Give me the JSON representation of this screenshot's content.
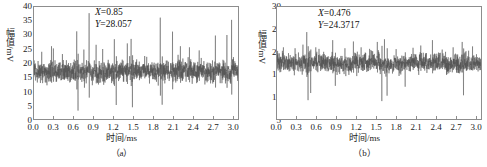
{
  "figure": {
    "background": "#ffffff",
    "trace_color": "#4a4a4a",
    "frame_color": "#8d8d8d"
  },
  "panel_a": {
    "caption": "（a）",
    "xlabel": "时间/ms",
    "ylabel_text": "幅值",
    "ylabel_unit": "/mV",
    "annotation": {
      "x_var": "X",
      "x_eq": "=0.85",
      "y_var": "Y",
      "y_eq": "=28.057"
    },
    "yticks": [
      "40",
      "35",
      "30",
      "25",
      "20",
      "15",
      "10",
      "5",
      "0"
    ],
    "xticks": [
      "0.0",
      "0.3",
      "0.6",
      "0.9",
      "1.2",
      "1.5",
      "1.8",
      "2.1",
      "2.4",
      "2.7",
      "3.0"
    ]
  },
  "panel_b": {
    "caption": "（b）",
    "xlabel": "时间/ms",
    "ylabel_text": "幅值",
    "ylabel_unit": "/mV",
    "annotation": {
      "x_var": "X",
      "x_eq": "=0.476",
      "y_var": "Y",
      "y_eq": "=24.3717"
    },
    "yticks": [
      "30",
      "25",
      "20",
      "15",
      "10",
      "5"
    ],
    "xticks": [
      "0.0",
      "0.3",
      "0.6",
      "0.9",
      "1.2",
      "1.5",
      "1.8",
      "2.1",
      "2.4",
      "2.7",
      "3.0"
    ]
  },
  "chart_data": [
    {
      "type": "line",
      "panel": "(a)",
      "title": "",
      "xlabel": "时间/ms",
      "ylabel": "幅值/mV",
      "xlim": [
        0.0,
        3.15
      ],
      "ylim": [
        0,
        40
      ],
      "xticks": [
        0.0,
        0.3,
        0.6,
        0.9,
        1.2,
        1.5,
        1.8,
        2.1,
        2.4,
        2.7,
        3.0
      ],
      "yticks": [
        0,
        5,
        10,
        15,
        20,
        25,
        30,
        35,
        40
      ],
      "grid": false,
      "legend": null,
      "annotations": [
        {
          "text": "X =0.85",
          "x": 1.35,
          "y": 37.5
        },
        {
          "text": "Y =28.057",
          "x": 1.35,
          "y": 34.5
        }
      ],
      "marked_point": {
        "x": 0.85,
        "y": 28.057
      },
      "series": [
        {
          "name": "envelope signal a",
          "description": "Dense noisy vibration signal, baseline about 17 mV, band 12-22 mV, with periodic impulse spikes.",
          "baseline": 17.0,
          "noise_band": [
            12.5,
            21.5
          ],
          "impulse_period_ms": 0.3,
          "peaks": [
            {
              "x": 0.12,
              "y": 24.0
            },
            {
              "x": 0.27,
              "y": 26.0
            },
            {
              "x": 0.3,
              "y": 25.2
            },
            {
              "x": 0.44,
              "y": 23.2
            },
            {
              "x": 0.66,
              "y": 31.3
            },
            {
              "x": 0.68,
              "y": 3.0
            },
            {
              "x": 0.77,
              "y": 24.8
            },
            {
              "x": 0.85,
              "y": 37.8
            },
            {
              "x": 0.96,
              "y": 26.5
            },
            {
              "x": 1.06,
              "y": 25.0
            },
            {
              "x": 1.24,
              "y": 28.5
            },
            {
              "x": 1.27,
              "y": 5.0
            },
            {
              "x": 1.44,
              "y": 27.0
            },
            {
              "x": 1.5,
              "y": 28.6
            },
            {
              "x": 1.52,
              "y": 4.2
            },
            {
              "x": 1.71,
              "y": 22.5
            },
            {
              "x": 1.95,
              "y": 36.2
            },
            {
              "x": 1.98,
              "y": 5.1
            },
            {
              "x": 2.14,
              "y": 31.2
            },
            {
              "x": 2.26,
              "y": 26.0
            },
            {
              "x": 2.4,
              "y": 25.6
            },
            {
              "x": 2.55,
              "y": 24.5
            },
            {
              "x": 2.8,
              "y": 29.8
            },
            {
              "x": 2.98,
              "y": 30.0
            },
            {
              "x": 3.05,
              "y": 35.4
            }
          ]
        }
      ]
    },
    {
      "type": "line",
      "panel": "(b)",
      "title": "",
      "xlabel": "时间/ms",
      "ylabel": "幅值/mV",
      "xlim": [
        0.0,
        3.15
      ],
      "ylim": [
        5,
        30
      ],
      "xticks": [
        0.0,
        0.3,
        0.6,
        0.9,
        1.2,
        1.5,
        1.8,
        2.1,
        2.4,
        2.7,
        3.0
      ],
      "yticks": [
        5,
        10,
        15,
        20,
        25,
        30
      ],
      "grid": false,
      "legend": null,
      "annotations": [
        {
          "text": "X =0.476",
          "x": 0.8,
          "y": 28.4
        },
        {
          "text": "Y =24.3717",
          "x": 0.8,
          "y": 26.6
        }
      ],
      "marked_point": {
        "x": 0.476,
        "y": 24.3717
      },
      "series": [
        {
          "name": "envelope signal b",
          "description": "Dense noisy vibration signal, baseline about 17.5 mV, band 15-20 mV, with downward impulse bursts.",
          "baseline": 17.5,
          "noise_band": [
            15.2,
            20.2
          ],
          "impulse_period_ms": 0.3,
          "peaks": [
            {
              "x": 0.1,
              "y": 21.0
            },
            {
              "x": 0.28,
              "y": 20.8
            },
            {
              "x": 0.4,
              "y": 21.6
            },
            {
              "x": 0.46,
              "y": 24.4
            },
            {
              "x": 0.48,
              "y": 9.2
            },
            {
              "x": 0.52,
              "y": 10.8
            },
            {
              "x": 0.6,
              "y": 21.0
            },
            {
              "x": 0.72,
              "y": 20.0
            },
            {
              "x": 0.86,
              "y": 22.6
            },
            {
              "x": 0.9,
              "y": 12.4
            },
            {
              "x": 1.05,
              "y": 20.8
            },
            {
              "x": 1.18,
              "y": 22.3
            },
            {
              "x": 1.3,
              "y": 21.0
            },
            {
              "x": 1.45,
              "y": 20.4
            },
            {
              "x": 1.55,
              "y": 22.2
            },
            {
              "x": 1.62,
              "y": 9.0
            },
            {
              "x": 1.66,
              "y": 22.8
            },
            {
              "x": 1.7,
              "y": 10.2
            },
            {
              "x": 1.84,
              "y": 20.6
            },
            {
              "x": 1.98,
              "y": 12.2
            },
            {
              "x": 2.1,
              "y": 20.9
            },
            {
              "x": 2.22,
              "y": 21.4
            },
            {
              "x": 2.4,
              "y": 22.6
            },
            {
              "x": 2.55,
              "y": 20.5
            },
            {
              "x": 2.72,
              "y": 21.0
            },
            {
              "x": 2.86,
              "y": 22.2
            },
            {
              "x": 2.88,
              "y": 10.3
            },
            {
              "x": 3.02,
              "y": 21.2
            }
          ]
        }
      ]
    }
  ]
}
